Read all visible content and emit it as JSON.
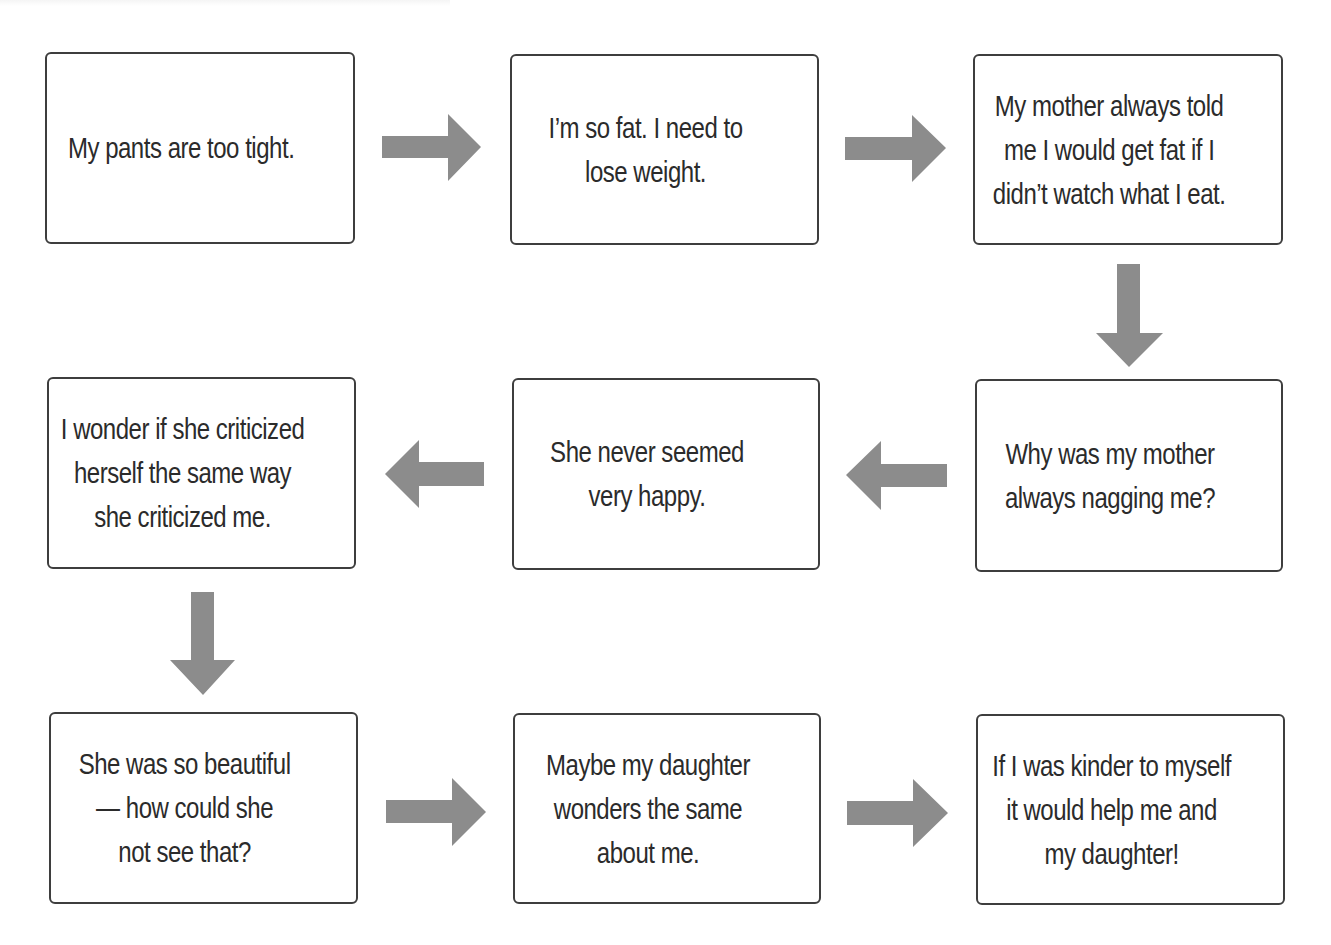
{
  "diagram": {
    "type": "flowchart",
    "direction": "serpentine",
    "colors": {
      "box_border": "#3e3e3e",
      "box_fill": "#ffffff",
      "text": "#2b2b2b",
      "arrow": "#8c8c8c",
      "background": "#ffffff"
    },
    "nodes": [
      {
        "id": "n1",
        "text": "My pants are too tight."
      },
      {
        "id": "n2",
        "text": "I’m so fat. I need to\nlose weight."
      },
      {
        "id": "n3",
        "text": "My mother always told\nme I would get fat if I\ndidn’t watch what I eat."
      },
      {
        "id": "n4",
        "text": "Why was my mother\nalways nagging me?"
      },
      {
        "id": "n5",
        "text": "She never seemed\nvery happy."
      },
      {
        "id": "n6",
        "text": "I wonder if she criticized\nherself the same way\nshe criticized me."
      },
      {
        "id": "n7",
        "text": "She was so beautiful\n— how could she\nnot see that?"
      },
      {
        "id": "n8",
        "text": "Maybe my daughter\nwonders the same\nabout me."
      },
      {
        "id": "n9",
        "text": "If I was kinder to myself\nit would help me and\nmy daughter!"
      }
    ],
    "edges": [
      {
        "from": "n1",
        "to": "n2",
        "arrow": "right"
      },
      {
        "from": "n2",
        "to": "n3",
        "arrow": "right"
      },
      {
        "from": "n3",
        "to": "n4",
        "arrow": "down"
      },
      {
        "from": "n4",
        "to": "n5",
        "arrow": "left"
      },
      {
        "from": "n5",
        "to": "n6",
        "arrow": "left"
      },
      {
        "from": "n6",
        "to": "n7",
        "arrow": "down"
      },
      {
        "from": "n7",
        "to": "n8",
        "arrow": "right"
      },
      {
        "from": "n8",
        "to": "n9",
        "arrow": "right"
      }
    ]
  }
}
